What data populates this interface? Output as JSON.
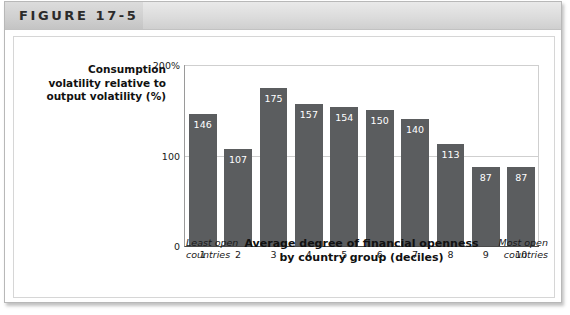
{
  "figure": {
    "number_label": "FIGURE 17-5"
  },
  "chart_data": {
    "type": "bar",
    "title": "",
    "categories": [
      "1",
      "2",
      "3",
      "4",
      "5",
      "6",
      "7",
      "8",
      "9",
      "10"
    ],
    "values": [
      146,
      107,
      175,
      157,
      154,
      150,
      140,
      113,
      87,
      87
    ],
    "ylabel": "Consumption volatility relative to output volatility (%)",
    "ylabel_lines": [
      "Consumption",
      "volatility relative to",
      "output volatility (%)"
    ],
    "xlabel": "Average degree of financial openness by country group (deciles)",
    "xlabel_lines": [
      "Average degree of financial openness",
      "by country group (deciles)"
    ],
    "x_caption_left_lines": [
      "Least open",
      "countries"
    ],
    "x_caption_right_lines": [
      "Most open",
      "countries"
    ],
    "ylim": [
      0,
      200
    ],
    "yticks": [
      0,
      100,
      200
    ],
    "ytick_labels": [
      "0",
      "100",
      "200%"
    ],
    "grid": true,
    "legend": "none",
    "bar_color": "#5b5d5f",
    "value_label_color": "#ffffff"
  }
}
